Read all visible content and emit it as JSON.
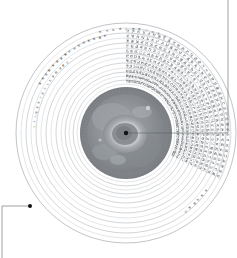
{
  "figure": {
    "type": "radial-chart",
    "title_arc": "天 文 圖 二 十 八 宿 星 位 全 圖",
    "center_label": "中 宮",
    "units_note": "度",
    "colors": {
      "ring_stroke": "#9aa0a6",
      "ring_faint": "#b9bec4",
      "leader": "#5b6166",
      "text": "#3d4247",
      "disc_dark": "#6f7377",
      "disc_mid": "#8e9296",
      "disc_light": "#c8cbce",
      "disc_core": "#f4f5f6",
      "marker": "#111316"
    }
  },
  "geometry": {
    "center_x": 126,
    "center_y": 133,
    "outer_radius": 110,
    "ring_count": 14,
    "inner_disc_radius": 46,
    "tick_count": 120
  },
  "rings": [
    {
      "index": 1,
      "radius": 110,
      "label": ""
    },
    {
      "index": 2,
      "radius": 105,
      "label": ""
    },
    {
      "index": 3,
      "radius": 100,
      "label": ""
    },
    {
      "index": 4,
      "radius": 95,
      "label": ""
    },
    {
      "index": 5,
      "radius": 90,
      "label": ""
    },
    {
      "index": 6,
      "radius": 85,
      "label": ""
    },
    {
      "index": 7,
      "radius": 80,
      "label": ""
    },
    {
      "index": 8,
      "radius": 75,
      "label": ""
    },
    {
      "index": 9,
      "radius": 70,
      "label": ""
    },
    {
      "index": 10,
      "radius": 65,
      "label": ""
    },
    {
      "index": 11,
      "radius": 61,
      "label": ""
    },
    {
      "index": 12,
      "radius": 57,
      "label": ""
    },
    {
      "index": 13,
      "radius": 53,
      "label": ""
    },
    {
      "index": 14,
      "radius": 49,
      "label": ""
    }
  ],
  "arc_labels": [
    {
      "id": "top-title",
      "text": "角亢氐房心尾箕斗牛女虛危",
      "radius": 104,
      "start_deg": -104,
      "char_step_deg": 3.6
    },
    {
      "id": "upper-left-a",
      "text": "室壁奎婁胃昴畢觜參井鬼柳星張翼軫",
      "radius": 99,
      "start_deg": -150,
      "char_step_deg": 3.2
    },
    {
      "id": "upper-left-b",
      "text": "二十八宿周天三百六十五度四分度之一",
      "radius": 92,
      "start_deg": -176,
      "char_step_deg": 3.1
    },
    {
      "id": "lower-right",
      "text": "歲差恆星東行",
      "radius": 98,
      "start_deg": 36,
      "char_step_deg": 3.4
    }
  ],
  "glyph_field": {
    "description": "dense radial micro-text occupying upper-right sector",
    "sector_start_deg": -92,
    "sector_end_deg": 62,
    "row_radii": [
      52,
      57,
      62,
      67,
      72,
      77,
      82,
      87,
      92,
      97,
      102
    ],
    "glyph_step_deg": 3.0
  },
  "markers": [
    {
      "id": "center-marker",
      "x": 126,
      "y": 133,
      "r": 2.2
    },
    {
      "id": "callout-marker",
      "x": 30,
      "y": 206,
      "r": 2.0
    }
  ],
  "leaders": [
    {
      "id": "center-to-right-edge",
      "points": "126,133 228,133"
    },
    {
      "id": "right-edge-vertical",
      "points": "228,0 228,133"
    },
    {
      "id": "callout-elbow",
      "points": "30,206 2,206 2,258"
    }
  ]
}
